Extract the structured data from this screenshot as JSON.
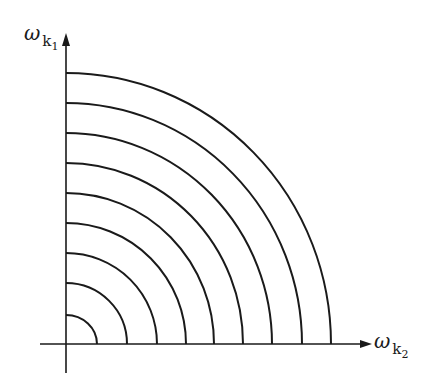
{
  "diagram": {
    "type": "concentric-quarter-circles",
    "y_axis_label": {
      "symbol": "ω",
      "subscript_base": "k",
      "subscript_index": "1"
    },
    "x_axis_label": {
      "symbol": "ω",
      "subscript_base": "k",
      "subscript_index": "2"
    },
    "origin": {
      "x": 66,
      "y": 344
    },
    "arc_count": 9,
    "arcs": [
      {
        "rx": 31,
        "ry": 29
      },
      {
        "rx": 61,
        "ry": 61
      },
      {
        "rx": 91,
        "ry": 91
      },
      {
        "rx": 120,
        "ry": 121
      },
      {
        "rx": 148,
        "ry": 151
      },
      {
        "rx": 177,
        "ry": 181
      },
      {
        "rx": 206,
        "ry": 211
      },
      {
        "rx": 236,
        "ry": 241
      },
      {
        "rx": 265,
        "ry": 271
      }
    ],
    "stroke_color": "#1a1a1a"
  }
}
